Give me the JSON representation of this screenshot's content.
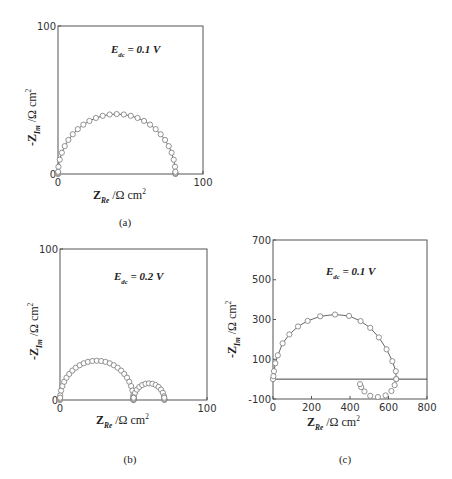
{
  "chart_data": [
    {
      "id": "a",
      "type": "scatter",
      "caption": "(a)",
      "annotation": {
        "main": "E",
        "sub": "dc",
        "rest": " = 0.1 V"
      },
      "xlabel": {
        "main": "Z",
        "sub": "Re",
        "unit": " /Ω cm",
        "sup": "2"
      },
      "ylabel": {
        "main": "-Z",
        "sub": "Im",
        "unit": " /Ω cm",
        "sup": "2"
      },
      "xlim": [
        0,
        100
      ],
      "ylim": [
        0,
        100
      ],
      "xticks": [
        "0",
        "100"
      ],
      "yticks": [
        "0",
        "100"
      ],
      "grid": false,
      "series": [
        {
          "name": "semicircle",
          "center": 40.5,
          "radius": 40.5,
          "y_scale": 1.0,
          "markers": "open-circle",
          "fit_line": true
        }
      ],
      "peak": {
        "x": 40,
        "y": 41
      },
      "x_intercepts": [
        0,
        81
      ]
    },
    {
      "id": "b",
      "type": "scatter",
      "caption": "(b)",
      "annotation": {
        "main": "E",
        "sub": "dc",
        "rest": " = 0.2 V"
      },
      "xlabel": {
        "main": "Z",
        "sub": "Re",
        "unit": " /Ω cm",
        "sup": "2"
      },
      "ylabel": {
        "main": "-Z",
        "sub": "Im",
        "unit": " /Ω cm",
        "sup": "2"
      },
      "xlim": [
        0,
        100
      ],
      "ylim": [
        0,
        100
      ],
      "xticks": [
        "0",
        "100"
      ],
      "yticks": [
        "0",
        "100"
      ],
      "grid": false,
      "series": [
        {
          "name": "arc-1",
          "center": 25,
          "radius": 25,
          "y_scale": 1.04,
          "markers": "open-circle"
        },
        {
          "name": "arc-2",
          "center": 60.5,
          "radius": 10.5,
          "y_scale": 1.05,
          "markers": "open-circle"
        }
      ],
      "peaks": [
        {
          "x": 25,
          "y": 26
        },
        {
          "x": 60,
          "y": 11
        }
      ],
      "x_intercepts": [
        0,
        50,
        71
      ]
    },
    {
      "id": "c",
      "type": "scatter",
      "caption": "(c)",
      "annotation": {
        "main": "E",
        "sub": "dc",
        "rest": " = 0.1 V"
      },
      "xlabel": {
        "main": "Z",
        "sub": "Re",
        "unit": " /Ω cm",
        "sup": "2"
      },
      "ylabel": {
        "main": "-Z",
        "sub": "Im",
        "unit": " /Ω cm",
        "sup": "2"
      },
      "xlim": [
        0,
        800
      ],
      "ylim": [
        -100,
        700
      ],
      "xticks": [
        "0",
        "200",
        "400",
        "600",
        "800"
      ],
      "yticks": [
        "-100",
        "100",
        "300",
        "500",
        "700"
      ],
      "grid": false,
      "zero_line": true,
      "series": [
        {
          "name": "capacitive-arc",
          "markers": "open-circle",
          "fit_line": true,
          "points": [
            [
              0,
              0
            ],
            [
              2,
              15
            ],
            [
              5,
              40
            ],
            [
              12,
              80
            ],
            [
              25,
              120
            ],
            [
              50,
              180
            ],
            [
              85,
              225
            ],
            [
              130,
              265
            ],
            [
              180,
              293
            ],
            [
              245,
              316
            ],
            [
              322,
              325
            ],
            [
              395,
              318
            ],
            [
              455,
              292
            ],
            [
              505,
              258
            ],
            [
              550,
              210
            ],
            [
              590,
              150
            ],
            [
              620,
              90
            ],
            [
              638,
              40
            ],
            [
              640,
              0
            ]
          ]
        },
        {
          "name": "inductive-loop",
          "markers": "open-circle",
          "points": [
            [
              640,
              0
            ],
            [
              632,
              -30
            ],
            [
              615,
              -60
            ],
            [
              585,
              -82
            ],
            [
              545,
              -90
            ],
            [
              505,
              -84
            ],
            [
              475,
              -62
            ],
            [
              458,
              -40
            ],
            [
              452,
              -25
            ]
          ]
        }
      ],
      "peak": {
        "x": 322,
        "y": 325
      },
      "x_intercept": 640,
      "min_point": {
        "x": 540,
        "y": -90
      }
    }
  ]
}
